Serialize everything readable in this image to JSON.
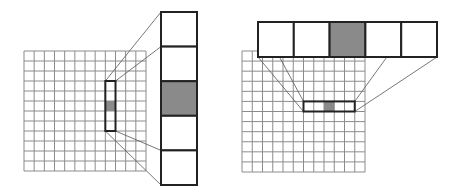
{
  "colors": {
    "background": "#ffffff",
    "grid_line": "#8c8c8c",
    "heavy_border": "#222222",
    "highlight_fill": "#8a8a8a",
    "connector": "#555555"
  },
  "panels": [
    {
      "id": "vertical-window",
      "grid": {
        "rows": 12,
        "cols": 12
      },
      "window": {
        "orientation": "vertical",
        "length": 5,
        "start_col": 8,
        "start_row": 3,
        "highlighted_index": 2
      },
      "magnified": {
        "orientation": "vertical",
        "cells": 5,
        "highlighted_index": 2
      }
    },
    {
      "id": "horizontal-window",
      "grid": {
        "rows": 12,
        "cols": 12
      },
      "window": {
        "orientation": "horizontal",
        "length": 5,
        "start_col": 6,
        "start_row": 5,
        "highlighted_index": 2
      },
      "magnified": {
        "orientation": "horizontal",
        "cells": 5,
        "highlighted_index": 2
      }
    }
  ]
}
